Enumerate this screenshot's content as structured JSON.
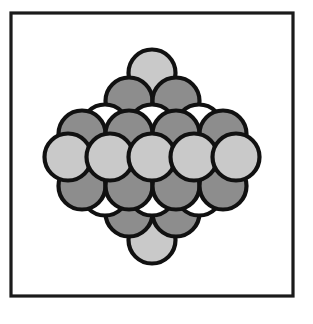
{
  "figure": {
    "title": "Close-packed sphere lattice",
    "caption": "",
    "canvas": {
      "width": 313,
      "height": 324,
      "background": "#ffffff"
    },
    "frame": {
      "name": "figure-border",
      "x": 11,
      "y": 13,
      "width": 282,
      "height": 283,
      "stroke": "#1a1a1a",
      "stroke_width": 3.2,
      "fill": "#ffffff"
    },
    "colors": {
      "outline": "#111111",
      "light_gray": "#c9c9c9",
      "dark_gray": "#8d8d8d",
      "white": "#ffffff",
      "background": "#ffffff"
    },
    "sphere_geometry": {
      "radius": 23.5,
      "diameter": 47,
      "outline_width": 4.2,
      "row_pitch_y": 30,
      "column_pitch_x": 47,
      "center_x": 152,
      "center_y": 157
    },
    "legend": {
      "shown": false,
      "entries": [
        {
          "label": "light-gray sphere",
          "color": "#c9c9c9"
        },
        {
          "label": "dark-gray sphere",
          "color": "#8d8d8d"
        },
        {
          "label": "white sphere",
          "color": "#ffffff"
        }
      ]
    },
    "rows": [
      {
        "index": 1,
        "y": 73,
        "count": 1,
        "shade": "light",
        "label": "top-apex-row"
      },
      {
        "index": 2,
        "y": 101,
        "count": 2,
        "shade": "dark",
        "label": "upper-dark-row-2"
      },
      {
        "index": 3,
        "y": 128,
        "count": 3,
        "shade": "white",
        "label": "upper-white-row-3"
      },
      {
        "index": 4,
        "y": 134,
        "count": 4,
        "shade": "dark",
        "label": "upper-dark-row-4"
      },
      {
        "index": 5,
        "y": 157,
        "count": 5,
        "shade": "light",
        "label": "middle-light-row-5"
      },
      {
        "index": 6,
        "y": 186,
        "count": 4,
        "shade": "dark",
        "label": "lower-dark-row-4"
      },
      {
        "index": 7,
        "y": 192,
        "count": 3,
        "shade": "white",
        "label": "lower-white-row-3"
      },
      {
        "index": 8,
        "y": 213,
        "count": 2,
        "shade": "dark",
        "label": "lower-dark-row-2"
      },
      {
        "index": 9,
        "y": 240,
        "count": 1,
        "shade": "light",
        "label": "bottom-apex-row"
      }
    ],
    "spheres": [
      {
        "id": 1,
        "cx": 152,
        "cy": 240,
        "shade": "light",
        "row": 9,
        "name": "sphere-bottom-apex"
      },
      {
        "id": 2,
        "cx": 129,
        "cy": 213,
        "shade": "dark",
        "row": 8,
        "name": "sphere-r8-c1"
      },
      {
        "id": 3,
        "cx": 176,
        "cy": 213,
        "shade": "dark",
        "row": 8,
        "name": "sphere-r8-c2"
      },
      {
        "id": 4,
        "cx": 105,
        "cy": 192,
        "shade": "white",
        "row": 7,
        "name": "sphere-r7-c1"
      },
      {
        "id": 5,
        "cx": 152,
        "cy": 192,
        "shade": "white",
        "row": 7,
        "name": "sphere-r7-c2"
      },
      {
        "id": 6,
        "cx": 199,
        "cy": 192,
        "shade": "white",
        "row": 7,
        "name": "sphere-r7-c3"
      },
      {
        "id": 7,
        "cx": 82,
        "cy": 186,
        "shade": "dark",
        "row": 6,
        "name": "sphere-r6-c1"
      },
      {
        "id": 8,
        "cx": 129,
        "cy": 186,
        "shade": "dark",
        "row": 6,
        "name": "sphere-r6-c2"
      },
      {
        "id": 9,
        "cx": 176,
        "cy": 186,
        "shade": "dark",
        "row": 6,
        "name": "sphere-r6-c3"
      },
      {
        "id": 10,
        "cx": 223,
        "cy": 186,
        "shade": "dark",
        "row": 6,
        "name": "sphere-r6-c4"
      },
      {
        "id": 11,
        "cx": 152,
        "cy": 73,
        "shade": "light",
        "row": 1,
        "name": "sphere-top-apex"
      },
      {
        "id": 12,
        "cx": 129,
        "cy": 101,
        "shade": "dark",
        "row": 2,
        "name": "sphere-r2-c1"
      },
      {
        "id": 13,
        "cx": 176,
        "cy": 101,
        "shade": "dark",
        "row": 2,
        "name": "sphere-r2-c2"
      },
      {
        "id": 14,
        "cx": 105,
        "cy": 128,
        "shade": "white",
        "row": 3,
        "name": "sphere-r3-c1"
      },
      {
        "id": 15,
        "cx": 152,
        "cy": 128,
        "shade": "white",
        "row": 3,
        "name": "sphere-r3-c2"
      },
      {
        "id": 16,
        "cx": 199,
        "cy": 128,
        "shade": "white",
        "row": 3,
        "name": "sphere-r3-c3"
      },
      {
        "id": 17,
        "cx": 82,
        "cy": 134,
        "shade": "dark",
        "row": 4,
        "name": "sphere-r4-c1"
      },
      {
        "id": 18,
        "cx": 129,
        "cy": 134,
        "shade": "dark",
        "row": 4,
        "name": "sphere-r4-c2"
      },
      {
        "id": 19,
        "cx": 176,
        "cy": 134,
        "shade": "dark",
        "row": 4,
        "name": "sphere-r4-c3"
      },
      {
        "id": 20,
        "cx": 223,
        "cy": 134,
        "shade": "dark",
        "row": 4,
        "name": "sphere-r4-c4"
      },
      {
        "id": 21,
        "cx": 68,
        "cy": 157,
        "shade": "light",
        "row": 5,
        "name": "sphere-r5-c1"
      },
      {
        "id": 22,
        "cx": 110,
        "cy": 157,
        "shade": "light",
        "row": 5,
        "name": "sphere-r5-c2"
      },
      {
        "id": 23,
        "cx": 152,
        "cy": 157,
        "shade": "light",
        "row": 5,
        "name": "sphere-r5-c3"
      },
      {
        "id": 24,
        "cx": 194,
        "cy": 157,
        "shade": "light",
        "row": 5,
        "name": "sphere-r5-c4"
      },
      {
        "id": 25,
        "cx": 236,
        "cy": 157,
        "shade": "light",
        "row": 5,
        "name": "sphere-r5-c5"
      }
    ]
  }
}
